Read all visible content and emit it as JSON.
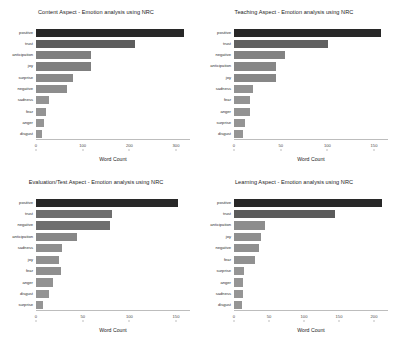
{
  "figure": {
    "background": "#ffffff",
    "bar_color_light": "#8c8c8c",
    "bar_color_dark": "#2e2e2e",
    "xlabel": "Word Count"
  },
  "chart_data": [
    {
      "type": "bar",
      "title": "Content Aspect - Emotion analysis using NRC",
      "xlabel": "Word Count",
      "ylabel": "",
      "orientation": "horizontal",
      "grid": false,
      "xlim": [
        0,
        330
      ],
      "xticks": [
        0,
        100,
        200,
        300
      ],
      "xtick_labels": [
        "0",
        "100",
        "200",
        "300"
      ],
      "categories": [
        "positive",
        "trust",
        "anticipation",
        "joy",
        "surprise",
        "negative",
        "sadness",
        "fear",
        "anger",
        "disgust"
      ],
      "values": [
        318,
        212,
        118,
        118,
        80,
        66,
        28,
        22,
        17,
        13
      ]
    },
    {
      "type": "bar",
      "title": "Teaching Aspect - Emotion analysis using NRC",
      "xlabel": "Word Count",
      "ylabel": "",
      "orientation": "horizontal",
      "grid": false,
      "xlim": [
        0,
        165
      ],
      "xticks": [
        0,
        50,
        100,
        150
      ],
      "xtick_labels": [
        "0",
        "50",
        "100",
        "150"
      ],
      "categories": [
        "positive",
        "trust",
        "negative",
        "anticipation",
        "joy",
        "sadness",
        "fear",
        "anger",
        "surprise",
        "disgust"
      ],
      "values": [
        158,
        101,
        55,
        45,
        45,
        20,
        17,
        17,
        12,
        10
      ]
    },
    {
      "type": "bar",
      "title": "Evaluation/Test Aspect - Emotion analysis using NRC",
      "xlabel": "Word Count",
      "ylabel": "",
      "orientation": "horizontal",
      "grid": false,
      "xlim": [
        0,
        165
      ],
      "xticks": [
        0,
        50,
        100,
        150
      ],
      "xtick_labels": [
        "0",
        "50",
        "100",
        "150"
      ],
      "categories": [
        "positive",
        "trust",
        "negative",
        "anticipation",
        "sadness",
        "joy",
        "fear",
        "anger",
        "disgust",
        "surprise"
      ],
      "values": [
        152,
        81,
        79,
        44,
        28,
        25,
        27,
        18,
        14,
        7
      ]
    },
    {
      "type": "bar",
      "title": "Learning Aspect - Emotion analysis using NRC",
      "xlabel": "Word Count",
      "ylabel": "",
      "orientation": "horizontal",
      "grid": false,
      "xlim": [
        0,
        220
      ],
      "xticks": [
        0,
        50,
        100,
        150,
        200
      ],
      "xtick_labels": [
        "0",
        "50",
        "100",
        "150",
        "200"
      ],
      "categories": [
        "positive",
        "trust",
        "anticipation",
        "joy",
        "negative",
        "fear",
        "surprise",
        "anger",
        "sadness",
        "disgust"
      ],
      "values": [
        212,
        144,
        44,
        38,
        35,
        30,
        14,
        13,
        13,
        11
      ]
    }
  ]
}
